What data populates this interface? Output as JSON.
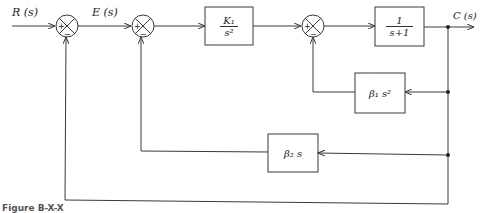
{
  "diagram": {
    "type": "control-system-block-diagram",
    "signals": {
      "input": "R (s)",
      "error": "E (s)",
      "output": "C (s)"
    },
    "blocks": {
      "forward_gain": {
        "numerator": "K₁",
        "denominator": "s²"
      },
      "plant": {
        "numerator": "1",
        "denominator": "s+1"
      },
      "inner_feedback": {
        "label": "β₁ s²"
      },
      "middle_feedback": {
        "label": "β₂ s"
      }
    },
    "summing_junctions": [
      {
        "id": "sum1",
        "plus": "+",
        "minus": "−"
      },
      {
        "id": "sum2",
        "plus": "+",
        "minus": "−"
      },
      {
        "id": "sum3",
        "plus": "+",
        "minus": "−"
      }
    ],
    "caption": "Figure B-X-X"
  },
  "colors": {
    "line": "#3a3a3a",
    "background": "#ffffff",
    "text": "#222222"
  }
}
